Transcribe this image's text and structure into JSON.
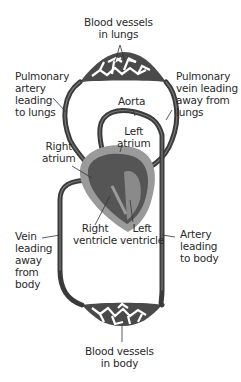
{
  "diagram": {
    "type": "double-circulation",
    "colors": {
      "vessel": "#3a3a3a",
      "vessel_highlight": "#7a7a7a",
      "heart_outer": "#9a9a9a",
      "heart_inner": "#555555",
      "capillary": "#4a4a4a",
      "leader": "#333333",
      "text": "#2a2a2a"
    },
    "labels": {
      "lung_vessels": "Blood vessels\nin lungs",
      "pulmonary_artery": "Pulmonary\nartery\nleading\nto lungs",
      "pulmonary_vein": "Pulmonary\nvein leading\naway from\nlungs",
      "aorta": "Aorta",
      "left_atrium": "Left\natrium",
      "right_atrium": "Right\natrium",
      "right_ventricle": "Right\nventricle",
      "left_ventricle": "Left\nventricle",
      "vein_from_body": "Vein\nleading\naway\nfrom\nbody",
      "artery_to_body": "Artery\nleading\nto body",
      "body_vessels": "Blood vessels\nin body"
    }
  }
}
